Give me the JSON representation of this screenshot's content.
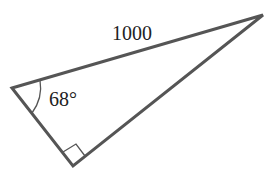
{
  "diagram": {
    "type": "right-triangle",
    "hypotenuse_label": "1000",
    "angle_label": "68°",
    "right_angle_marker": true,
    "stroke_color": "#555555",
    "vertices": {
      "left": [
        12,
        88
      ],
      "top_right": [
        263,
        15
      ],
      "bottom": [
        73,
        166
      ]
    }
  }
}
